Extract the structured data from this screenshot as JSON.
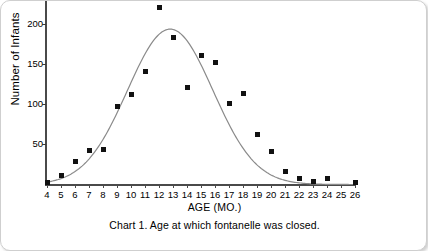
{
  "chart_data": {
    "type": "scatter",
    "title": "Chart 1. Age at which fontanelle was closed.",
    "xlabel": "AGE (MO.)",
    "ylabel": "Number of Infants",
    "xlim": [
      4,
      26
    ],
    "ylim": [
      0,
      220
    ],
    "grid": false,
    "legend": "none",
    "xticks": [
      4,
      5,
      6,
      7,
      8,
      9,
      10,
      11,
      12,
      13,
      14,
      15,
      16,
      17,
      18,
      19,
      20,
      21,
      22,
      23,
      24,
      25,
      26
    ],
    "yticks": [
      50,
      100,
      150,
      200
    ],
    "categories": [
      4,
      5,
      6,
      7,
      8,
      9,
      10,
      11,
      12,
      13,
      14,
      15,
      16,
      17,
      18,
      19,
      20,
      21,
      22,
      23,
      24,
      26
    ],
    "values": [
      3,
      11,
      29,
      42,
      44,
      97,
      112,
      140,
      220,
      182,
      120,
      160,
      152,
      101,
      113,
      62,
      41,
      16,
      8,
      4,
      8,
      3
    ],
    "series": [
      {
        "name": "Number of Infants",
        "marker": "square",
        "marker_color": "#111111",
        "points": [
          {
            "x": 4,
            "y": 3
          },
          {
            "x": 5,
            "y": 11
          },
          {
            "x": 6,
            "y": 29
          },
          {
            "x": 7,
            "y": 42
          },
          {
            "x": 8,
            "y": 44
          },
          {
            "x": 9,
            "y": 97
          },
          {
            "x": 10,
            "y": 112
          },
          {
            "x": 11,
            "y": 140
          },
          {
            "x": 12,
            "y": 220
          },
          {
            "x": 13,
            "y": 182
          },
          {
            "x": 14,
            "y": 120
          },
          {
            "x": 15,
            "y": 160
          },
          {
            "x": 16,
            "y": 152
          },
          {
            "x": 17,
            "y": 101
          },
          {
            "x": 18,
            "y": 113
          },
          {
            "x": 19,
            "y": 62
          },
          {
            "x": 20,
            "y": 41
          },
          {
            "x": 21,
            "y": 16
          },
          {
            "x": 22,
            "y": 8
          },
          {
            "x": 23,
            "y": 4
          },
          {
            "x": 24,
            "y": 8
          },
          {
            "x": 26,
            "y": 3
          }
        ]
      },
      {
        "name": "fitted normal curve",
        "type": "line",
        "line_color": "#8a8a8a",
        "peak_x": 12.8,
        "peak_y": 193,
        "sigma": 3.05
      }
    ]
  },
  "caption": {
    "text": "Chart 1. Age at which fontanelle was closed."
  }
}
